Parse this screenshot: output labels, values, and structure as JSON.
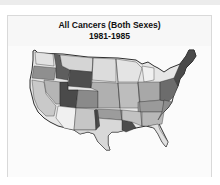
{
  "map": {
    "title": "All Cancers (Both Sexes)",
    "subtitle": "1981-1985",
    "region": "Contiguous United States",
    "shading": "grayscale choropleth by county",
    "colors": {
      "background": "#fafafa",
      "border": "#d9d9d9",
      "outline": "#1a1a1a",
      "shade_light": "#e8e8e8",
      "shade_mid_light": "#c4c4c4",
      "shade_mid": "#9a9a9a",
      "shade_dark": "#6a6a6a",
      "shade_darkest": "#474747"
    }
  }
}
